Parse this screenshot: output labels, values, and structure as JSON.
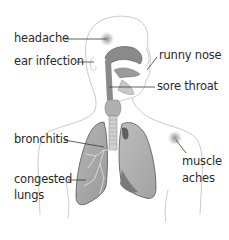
{
  "diagram": {
    "labels": {
      "headache": "headache",
      "ear_infection": "ear infection",
      "runny_nose": "runny nose",
      "sore_throat": "sore throat",
      "bronchitis": "bronchitis",
      "congested_lungs_line1": "congested",
      "congested_lungs_line2": "lungs",
      "muscle_aches_line1": "muscle",
      "muscle_aches_line2": "aches"
    },
    "colors": {
      "outline": "#b8b8b8",
      "lung_fill": "#a9a9a9",
      "lung_dark": "#6f6f6f",
      "airway": "#8e8e8e",
      "leader_line": "#3a3a3a",
      "text": "#2a2a2a",
      "pain_spot": "#7a7a7a"
    }
  }
}
